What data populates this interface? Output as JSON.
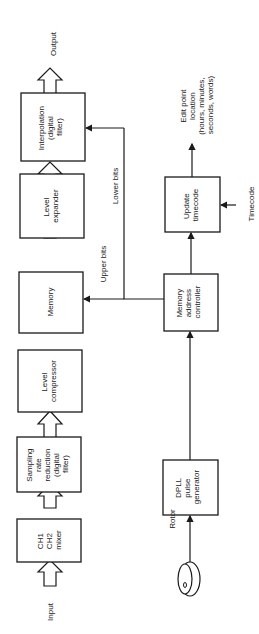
{
  "diagram": {
    "blocks": {
      "mixer": [
        "CH1",
        "CH2",
        "mixer"
      ],
      "sampling": [
        "Sampling",
        "rate",
        "reduction",
        "(digital",
        "filter)"
      ],
      "compressor": [
        "Level",
        "compressor"
      ],
      "memory": [
        "Memory"
      ],
      "expander": [
        "Level",
        "expander"
      ],
      "interpolation": [
        "Interpolation",
        "(digital",
        "filter)"
      ],
      "dpll": [
        "DPLL",
        "pulse",
        "generator"
      ],
      "mac": [
        "Memory",
        "address",
        "controller"
      ],
      "update": [
        "Update",
        "timecode"
      ]
    },
    "labels": {
      "input": "Input",
      "output": "Output",
      "upper_bits": "Upper bits",
      "lower_bits": "Lower bits",
      "rotor": "Rotor",
      "timecode": "Timecode",
      "edit_point": [
        "Edit point",
        "location",
        "(hours, minutes,",
        "seconds, words)"
      ]
    }
  }
}
